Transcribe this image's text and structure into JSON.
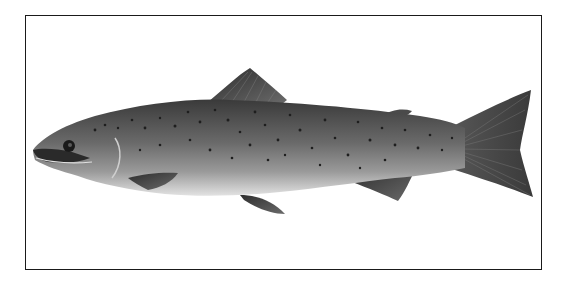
{
  "image": {
    "subject": "Atlantic salmon illustration",
    "description": "Side-view illustration of a spotted salmon facing left, inside a thin black rectangular frame on white background",
    "colors": {
      "background": "#ffffff",
      "frame": "#1a1a1a",
      "body_dark": "#3c3c3c",
      "body_mid": "#6e6e6e",
      "belly": "#d8d8d8",
      "fin": "#4a4a4a",
      "spot": "#1e1e1e"
    }
  }
}
